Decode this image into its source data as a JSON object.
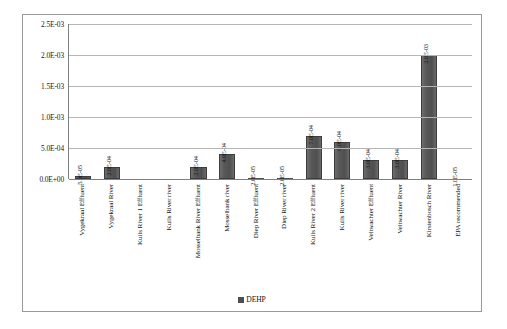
{
  "chart_data": {
    "type": "bar",
    "title": "",
    "xlabel": "",
    "ylabel": "",
    "ylim": [
      0,
      0.0025
    ],
    "grid": true,
    "legend_position": "bottom",
    "series": [
      {
        "name": "DEHP",
        "color": "#4f4f4f",
        "values": [
          5e-05,
          0.0002,
          null,
          null,
          0.0002,
          0.0004,
          2e-05,
          2e-05,
          0.0007,
          0.0006,
          0.0003,
          0.0003,
          0.002,
          null
        ]
      }
    ],
    "categories": [
      "Vygekraal Effluent",
      "Vygekraal River",
      "Kuils River 1 Effluent",
      "Kuils River river",
      "Mosselbank River Effluent",
      "Mosselbank river",
      "Diep River Effluent",
      "Diep River river",
      "Kuils River 2 Effluent",
      "Kuils River river",
      "Veltwachter Effluent",
      "Veltwachter River",
      "Kirstenbosch River",
      "EPA recommended"
    ],
    "data_labels": [
      "5.0E-05",
      "2.0E-04",
      "",
      "",
      "2.0E-04",
      "4.0E-04",
      "2.0E-05",
      "2.0E-05",
      "7.0E-04",
      "6.0E-04",
      "3.0E-04",
      "3.0E-04",
      "2.0E-03",
      "1.0E-05"
    ],
    "yticks": [
      {
        "value": 0.0025,
        "label": "2.5E-03"
      },
      {
        "value": 0.002,
        "label": "2.0E-03"
      },
      {
        "value": 0.0015,
        "label": "1.5E-03"
      },
      {
        "value": 0.001,
        "label": "1.0E-03"
      },
      {
        "value": 0.0005,
        "label": "5.0E-04"
      },
      {
        "value": 0.0,
        "label": "0.0E+00"
      }
    ],
    "legend": [
      {
        "label": "DEHP",
        "color": "#4f4f4f"
      }
    ]
  }
}
